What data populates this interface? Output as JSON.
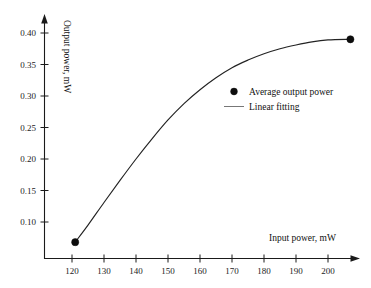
{
  "chart_data": {
    "type": "line",
    "title": "",
    "xlabel": "Input power, mW",
    "ylabel": "Output power, mW",
    "xlim": [
      113,
      212
    ],
    "ylim": [
      0.055,
      0.415
    ],
    "grid": false,
    "legend_position": "center-right",
    "x_ticks": [
      120,
      130,
      140,
      150,
      160,
      170,
      180,
      190,
      200
    ],
    "x_tick_labels": [
      "120",
      "130",
      "140",
      "150",
      "160",
      "170",
      "180",
      "190",
      "200"
    ],
    "y_ticks": [
      0.1,
      0.15,
      0.2,
      0.25,
      0.3,
      0.35,
      0.4
    ],
    "y_tick_labels": [
      "0.10",
      "0.15",
      "0.20",
      "0.25",
      "0.30",
      "0.35",
      "0.40"
    ],
    "series": [
      {
        "name": "Average output power",
        "marker": "filled-circle",
        "x": [
          121,
          207
        ],
        "values": [
          0.068,
          0.39
        ]
      },
      {
        "name": "Linear fitting",
        "marker": "line",
        "x": [
          121,
          125,
          130,
          135,
          140,
          145,
          150,
          155,
          160,
          165,
          170,
          175,
          180,
          185,
          190,
          195,
          200,
          207
        ],
        "values": [
          0.068,
          0.095,
          0.131,
          0.166,
          0.2,
          0.232,
          0.262,
          0.288,
          0.31,
          0.329,
          0.345,
          0.357,
          0.367,
          0.375,
          0.381,
          0.386,
          0.389,
          0.39
        ]
      }
    ],
    "annotations": []
  },
  "legend": {
    "items": [
      {
        "label": "Average output power",
        "symbol": "filled-circle"
      },
      {
        "label": "Linear fitting",
        "symbol": "line-segment"
      }
    ]
  },
  "colors": {
    "background": "#ffffff",
    "axis": "#1a1a1a",
    "curve": "#232323",
    "marker": "#0d0d0d",
    "legend_line": "#777777",
    "text": "#111111"
  }
}
